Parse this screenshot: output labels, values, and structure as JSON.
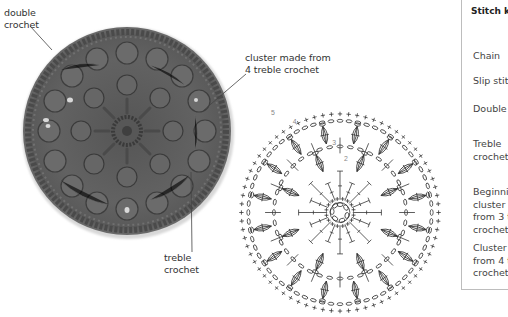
{
  "photo": {
    "alt": "crocheted circular motif in grey yarn with puff clusters",
    "yarn_color": "#5f5f5f",
    "labels": {
      "double_crochet": [
        "double",
        "crochet"
      ],
      "cluster": [
        "cluster made from",
        "4 treble crochet"
      ],
      "treble_crochet": [
        "treble",
        "crochet"
      ]
    }
  },
  "chart": {
    "row_numbers": [
      "2",
      "3",
      "4",
      "5"
    ],
    "line_color": "#333333"
  },
  "stitch_key": {
    "title": "Stitch k",
    "items": [
      {
        "label": "Chain"
      },
      {
        "label": "Slip stit"
      },
      {
        "label": "Double"
      },
      {
        "label": "Treble\ncrochet"
      },
      {
        "label": "Beginni\ncluster i\nfrom 3 t\ncrochet"
      },
      {
        "label": "Cluster\nfrom 4 t\ncrochet"
      }
    ]
  }
}
